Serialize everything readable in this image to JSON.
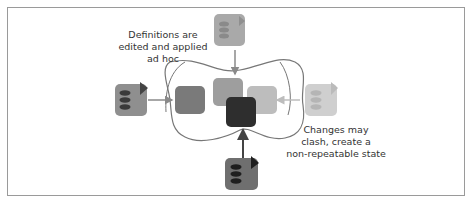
{
  "diagram": {
    "annotations": {
      "top_left": [
        "Definitions are",
        "edited and applied",
        "ad hoc"
      ],
      "bottom_right": [
        "Changes may",
        "clash, create a",
        "non-repeatable state"
      ]
    },
    "sources": [
      {
        "id": "source-top",
        "position": "top",
        "shade": "light-gray",
        "color": "#a9a9a9"
      },
      {
        "id": "source-left",
        "position": "left",
        "shade": "mid-gray",
        "color": "#8f8f8f"
      },
      {
        "id": "source-right",
        "position": "right",
        "shade": "very-light-gray",
        "color": "#cfcfcf"
      },
      {
        "id": "source-bottom",
        "position": "bottom",
        "shade": "dark-gray",
        "color": "#6f6f6f"
      }
    ],
    "environment": {
      "boundary": "wavy-outline",
      "blocks": [
        {
          "id": "block-left",
          "color": "#7a7a7a"
        },
        {
          "id": "block-top",
          "color": "#9e9e9e"
        },
        {
          "id": "block-right",
          "color": "#bdbdbd"
        },
        {
          "id": "block-center",
          "color": "#2e2e2e"
        }
      ]
    }
  }
}
